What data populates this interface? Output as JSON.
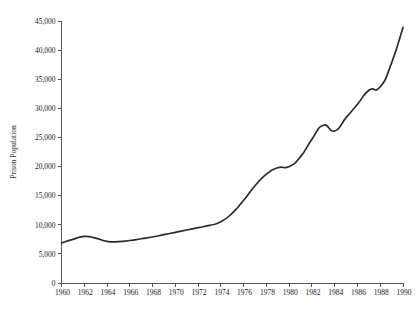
{
  "chart_data": {
    "type": "line",
    "title": "",
    "subtitle": "",
    "xlabel": "",
    "ylabel": "Prison Population",
    "xlim": [
      1960,
      1990
    ],
    "ylim": [
      0,
      45000
    ],
    "grid": false,
    "legend": false,
    "legend_position": "none",
    "line_color": "#2b2b2b",
    "axis_color": "#555555",
    "background_color": "#ffffff",
    "x_tick_labels": [
      "1960",
      "1962",
      "1964",
      "1966",
      "1968",
      "1970",
      "1972",
      "1974",
      "1976",
      "1978",
      "1980",
      "1982",
      "1984",
      "1986",
      "1988",
      "1990"
    ],
    "x_tick_values": [
      1960,
      1962,
      1964,
      1966,
      1968,
      1970,
      1972,
      1974,
      1976,
      1978,
      1980,
      1982,
      1984,
      1986,
      1988,
      1990
    ],
    "y_tick_labels": [
      "0",
      "5,000",
      "10,000",
      "15,000",
      "20,000",
      "25,000",
      "30,000",
      "35,000",
      "40,000",
      "45,000"
    ],
    "y_tick_values": [
      0,
      5000,
      10000,
      15000,
      20000,
      25000,
      30000,
      35000,
      40000,
      45000
    ],
    "series": [
      {
        "name": "Prison Population",
        "x": [
          1960,
          1961,
          1962,
          1963,
          1964,
          1965,
          1966,
          1967,
          1968,
          1969,
          1970,
          1971,
          1972,
          1973,
          1974,
          1975,
          1976,
          1977,
          1978,
          1979,
          1980,
          1981,
          1982,
          1983,
          1984,
          1985,
          1986,
          1987,
          1988,
          1989,
          1990
        ],
        "values": [
          6900,
          7500,
          8000,
          7700,
          7150,
          7100,
          7300,
          7600,
          7900,
          8300,
          8700,
          9100,
          9500,
          9900,
          10500,
          12000,
          14200,
          16700,
          18700,
          19800,
          20000,
          21700,
          24700,
          27100,
          26100,
          28400,
          30700,
          33100,
          33700,
          37800,
          43900
        ]
      }
    ]
  }
}
